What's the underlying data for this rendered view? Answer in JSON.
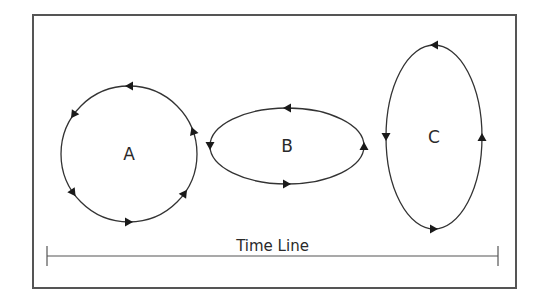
{
  "diagram": {
    "frame": {
      "x": 33,
      "y": 15,
      "width": 483,
      "height": 273,
      "stroke": "#555555"
    },
    "stroke_color": "#333333",
    "shapes": [
      {
        "id": "A",
        "label": "A",
        "kind": "circle",
        "cx": 129,
        "cy": 154,
        "rx": 68,
        "ry": 68,
        "direction": "counter-clockwise",
        "arrows": [
          {
            "angle": 90,
            "note": "top, pointing left"
          },
          {
            "angle": 145,
            "note": "upper-left, pointing down-left"
          },
          {
            "angle": 215,
            "note": "lower-left, pointing down-right"
          },
          {
            "angle": 270,
            "note": "bottom, pointing right"
          },
          {
            "angle": 325,
            "note": "lower-right, pointing up-right"
          },
          {
            "angle": 20,
            "note": "upper-right, pointing up"
          }
        ]
      },
      {
        "id": "B",
        "label": "B",
        "kind": "ellipse",
        "cx": 287,
        "cy": 146,
        "rx": 77,
        "ry": 38,
        "direction": "counter-clockwise",
        "arrows": [
          {
            "angle": 90,
            "note": "top, pointing left"
          },
          {
            "angle": 180,
            "note": "left, pointing down"
          },
          {
            "angle": 270,
            "note": "bottom, pointing right"
          },
          {
            "angle": 0,
            "note": "right, pointing up"
          }
        ]
      },
      {
        "id": "C",
        "label": "C",
        "kind": "ellipse",
        "cx": 434,
        "cy": 137,
        "rx": 48,
        "ry": 92,
        "direction": "counter-clockwise",
        "arrows": [
          {
            "angle": 90,
            "note": "top, pointing left"
          },
          {
            "angle": 180,
            "note": "left, pointing down"
          },
          {
            "angle": 270,
            "note": "bottom, pointing right"
          },
          {
            "angle": 0,
            "note": "right, pointing up"
          }
        ]
      }
    ],
    "timeline": {
      "label": "Time Line",
      "x1": 47,
      "x2": 498,
      "y": 256,
      "tick_half": 10
    }
  }
}
